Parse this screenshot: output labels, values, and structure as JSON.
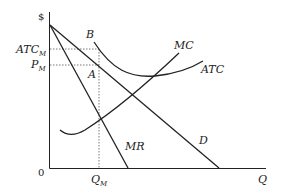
{
  "diagram": {
    "axes": {
      "y_label": "$",
      "x_label": "Q",
      "origin_label": "0"
    },
    "price_labels": {
      "atc_m": "ATC",
      "atc_m_sub": "M",
      "p_m": "P",
      "p_m_sub": "M"
    },
    "quantity_labels": {
      "q_m": "Q",
      "q_m_sub": "M"
    },
    "points": {
      "a": "A",
      "b": "B"
    },
    "curves": {
      "mc": "MC",
      "atc": "ATC",
      "mr": "MR",
      "d": "D"
    },
    "colors": {
      "line": "#222222",
      "guide": "#555555",
      "background": "#ffffff"
    }
  }
}
